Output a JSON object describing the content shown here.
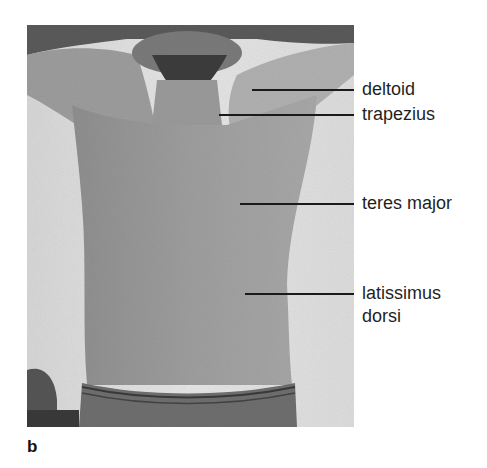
{
  "figure": {
    "panel_letter": "b",
    "labels": [
      {
        "id": "deltoid",
        "text": "deltoid"
      },
      {
        "id": "trapezius",
        "text": "trapezius"
      },
      {
        "id": "teres-major",
        "text": "teres major"
      },
      {
        "id": "latissimus-dorsi",
        "line1": "latissimus",
        "line2": "dorsi"
      }
    ],
    "colors": {
      "background": "#ffffff",
      "photo_bg": "#dcdcdc",
      "skin": "#9a9a9a",
      "leader": "#1a1a1a",
      "text": "#1f1f1f"
    }
  }
}
